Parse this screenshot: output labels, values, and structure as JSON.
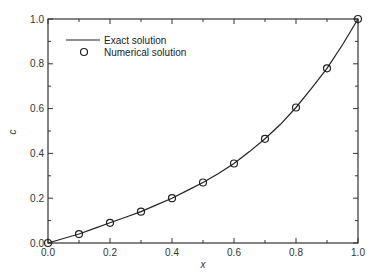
{
  "chart_data": {
    "type": "line",
    "title": "",
    "xlabel": "x",
    "ylabel": "c",
    "xlim": [
      0,
      1.0
    ],
    "ylim": [
      0,
      1.0
    ],
    "grid": false,
    "legend_position": "upper left",
    "x_ticks": [
      "0.0",
      "0.2",
      "0.4",
      "0.6",
      "0.8",
      "1.0"
    ],
    "y_ticks": [
      "0.0",
      "0.2",
      "0.4",
      "0.6",
      "0.8",
      "1.0"
    ],
    "series": [
      {
        "name": "Exact solution",
        "style": "line",
        "x": [
          0.0,
          0.05,
          0.1,
          0.15,
          0.2,
          0.25,
          0.3,
          0.35,
          0.4,
          0.45,
          0.5,
          0.55,
          0.6,
          0.65,
          0.7,
          0.75,
          0.8,
          0.85,
          0.9,
          0.95,
          1.0
        ],
        "values": [
          0.0,
          0.02,
          0.04,
          0.065,
          0.09,
          0.115,
          0.14,
          0.17,
          0.2,
          0.235,
          0.27,
          0.31,
          0.355,
          0.408,
          0.465,
          0.53,
          0.605,
          0.69,
          0.78,
          0.885,
          1.0
        ]
      },
      {
        "name": "Numerical solution",
        "style": "open-circle",
        "x": [
          0.0,
          0.1,
          0.2,
          0.3,
          0.4,
          0.5,
          0.6,
          0.7,
          0.8,
          0.9,
          1.0
        ],
        "values": [
          0.0,
          0.04,
          0.09,
          0.14,
          0.2,
          0.27,
          0.355,
          0.465,
          0.605,
          0.78,
          1.0
        ]
      }
    ]
  },
  "legend": {
    "items": [
      {
        "label": "Exact solution",
        "icon": "line-icon"
      },
      {
        "label": "Numerical solution",
        "icon": "open-circle-icon"
      }
    ]
  },
  "axes": {
    "xlabel": "x",
    "ylabel": "c"
  },
  "colors": {
    "line": "#222222",
    "axis": "#333333"
  }
}
